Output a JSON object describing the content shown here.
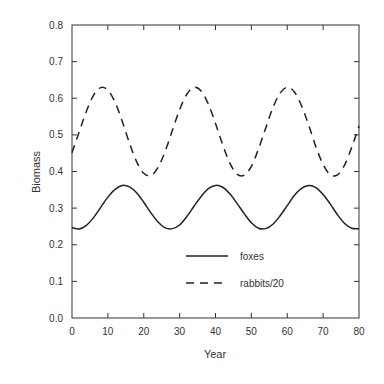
{
  "chart_data": {
    "type": "line",
    "title": "",
    "xlabel": "Year",
    "ylabel": "Biomass",
    "xlim": [
      0,
      80
    ],
    "ylim": [
      0.0,
      0.8
    ],
    "grid": false,
    "legend_position": "lower center (inside plot)",
    "x_ticks": [
      "0",
      "10",
      "20",
      "30",
      "40",
      "50",
      "60",
      "70",
      "80"
    ],
    "y_ticks": [
      "0.0",
      "0.1",
      "0.2",
      "0.3",
      "0.4",
      "0.5",
      "0.6",
      "0.7",
      "0.8"
    ],
    "x": [
      0,
      2,
      4,
      6,
      8,
      10,
      12,
      14,
      16,
      18,
      20,
      22,
      24,
      26,
      28,
      30,
      32,
      34,
      36,
      38,
      40,
      42,
      44,
      46,
      48,
      50,
      52,
      54,
      56,
      58,
      60,
      62,
      64,
      66,
      68,
      70,
      72,
      74,
      76,
      78,
      80
    ],
    "series": [
      {
        "name": "foxes",
        "style": "solid",
        "color": "#222222",
        "values": [
          0.247,
          0.243,
          0.253,
          0.274,
          0.302,
          0.33,
          0.351,
          0.362,
          0.358,
          0.342,
          0.316,
          0.287,
          0.262,
          0.246,
          0.244,
          0.254,
          0.277,
          0.305,
          0.332,
          0.353,
          0.362,
          0.357,
          0.339,
          0.313,
          0.285,
          0.26,
          0.245,
          0.244,
          0.256,
          0.279,
          0.307,
          0.335,
          0.354,
          0.362,
          0.356,
          0.337,
          0.311,
          0.282,
          0.258,
          0.245,
          0.244
        ]
      },
      {
        "name": "rabbits/20",
        "style": "dashed",
        "color": "#222222",
        "values": [
          0.451,
          0.508,
          0.564,
          0.608,
          0.629,
          0.622,
          0.589,
          0.537,
          0.478,
          0.427,
          0.395,
          0.389,
          0.411,
          0.456,
          0.513,
          0.569,
          0.611,
          0.63,
          0.62,
          0.584,
          0.531,
          0.473,
          0.423,
          0.393,
          0.39,
          0.414,
          0.462,
          0.519,
          0.574,
          0.614,
          0.63,
          0.617,
          0.579,
          0.526,
          0.467,
          0.419,
          0.391,
          0.391,
          0.418,
          0.467,
          0.524
        ]
      }
    ]
  },
  "legend": {
    "items": [
      {
        "label": "foxes",
        "style": "solid"
      },
      {
        "label": "rabbits/20",
        "style": "dashed"
      }
    ]
  },
  "plot": {
    "left": 72,
    "right": 359,
    "top": 25,
    "bottom": 318
  }
}
